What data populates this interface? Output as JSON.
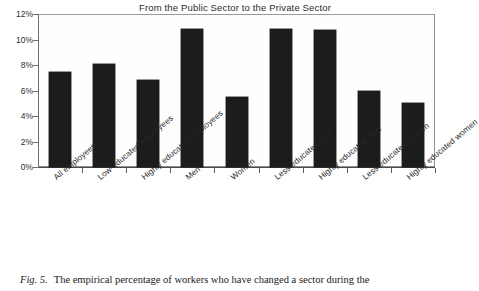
{
  "chart_data": {
    "type": "bar",
    "title": "From the Public Sector to the Private Sector",
    "xlabel": "",
    "ylabel": "",
    "ylim": [
      0,
      12
    ],
    "yticks": [
      "0%",
      "2%",
      "4%",
      "6%",
      "8%",
      "10%",
      "12%"
    ],
    "ytick_values": [
      0,
      2,
      4,
      6,
      8,
      10,
      12
    ],
    "grid": false,
    "legend": "none",
    "bar_color": "#1c1c1c",
    "categories": [
      "All employees",
      "Low-educated employees",
      "Highly educated employees",
      "Men",
      "Women",
      "Less educated men",
      "Highly educated men",
      "Less educated women",
      "Highly educated women"
    ],
    "values": [
      7.45,
      8.05,
      6.85,
      10.8,
      5.5,
      10.85,
      10.75,
      5.95,
      5.0
    ]
  },
  "caption": {
    "figure_number": "Fig. 5.",
    "text": "The empirical percentage of workers who have changed a sector during the"
  }
}
